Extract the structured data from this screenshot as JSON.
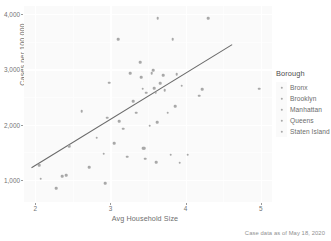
{
  "chart_data": {
    "type": "scatter",
    "title": "",
    "xlabel": "Avg Household Size",
    "ylabel": "Cases per 100,000",
    "caption": "Case data as of May 18, 2020",
    "xlim": [
      1.85,
      5.15
    ],
    "ylim": [
      600,
      4150
    ],
    "xticks": [
      2,
      3,
      4,
      5
    ],
    "xtick_labels": [
      "2",
      "3",
      "4",
      "5"
    ],
    "yticks": [
      1000,
      2000,
      3000,
      4000
    ],
    "ytick_labels": [
      "1,000",
      "2,000",
      "3,000",
      "4,000"
    ],
    "grid": true,
    "point_color": "#a8a8a8",
    "line_color": "#6b6b6b",
    "panel_color": "#fafafa",
    "legend": {
      "title": "Borough",
      "position": "right",
      "entries": [
        {
          "label": "Bronx"
        },
        {
          "label": "Brooklyn"
        },
        {
          "label": "Manhattan"
        },
        {
          "label": "Queens"
        },
        {
          "label": "Staten Island"
        }
      ]
    },
    "trendline": {
      "type": "linear",
      "x": [
        1.95,
        4.62
      ],
      "y": [
        1220,
        3450
      ]
    },
    "points": [
      {
        "x": 2.05,
        "y": 1265
      },
      {
        "x": 2.07,
        "y": 1025
      },
      {
        "x": 2.28,
        "y": 845
      },
      {
        "x": 2.36,
        "y": 1065
      },
      {
        "x": 2.41,
        "y": 1080
      },
      {
        "x": 2.45,
        "y": 1610
      },
      {
        "x": 2.62,
        "y": 2245
      },
      {
        "x": 2.72,
        "y": 1225
      },
      {
        "x": 2.82,
        "y": 1765
      },
      {
        "x": 2.91,
        "y": 1475
      },
      {
        "x": 2.93,
        "y": 940
      },
      {
        "x": 2.96,
        "y": 2125
      },
      {
        "x": 2.98,
        "y": 2760
      },
      {
        "x": 3.05,
        "y": 1665
      },
      {
        "x": 3.1,
        "y": 3545
      },
      {
        "x": 3.12,
        "y": 2060
      },
      {
        "x": 3.17,
        "y": 1925
      },
      {
        "x": 3.22,
        "y": 1420
      },
      {
        "x": 3.26,
        "y": 2930
      },
      {
        "x": 3.3,
        "y": 2425
      },
      {
        "x": 3.34,
        "y": 2215
      },
      {
        "x": 3.4,
        "y": 3130
      },
      {
        "x": 3.41,
        "y": 2855
      },
      {
        "x": 3.43,
        "y": 2655
      },
      {
        "x": 3.44,
        "y": 1575
      },
      {
        "x": 3.45,
        "y": 1570
      },
      {
        "x": 3.46,
        "y": 1385
      },
      {
        "x": 3.48,
        "y": 2580
      },
      {
        "x": 3.52,
        "y": 1985
      },
      {
        "x": 3.55,
        "y": 2935
      },
      {
        "x": 3.57,
        "y": 2990
      },
      {
        "x": 3.58,
        "y": 2665
      },
      {
        "x": 3.6,
        "y": 2580
      },
      {
        "x": 3.61,
        "y": 1325
      },
      {
        "x": 3.62,
        "y": 2045
      },
      {
        "x": 3.63,
        "y": 3930
      },
      {
        "x": 3.66,
        "y": 2755
      },
      {
        "x": 3.7,
        "y": 2900
      },
      {
        "x": 3.72,
        "y": 2625
      },
      {
        "x": 3.76,
        "y": 2215
      },
      {
        "x": 3.8,
        "y": 1455
      },
      {
        "x": 3.83,
        "y": 3545
      },
      {
        "x": 3.86,
        "y": 2330
      },
      {
        "x": 3.88,
        "y": 2910
      },
      {
        "x": 3.92,
        "y": 1310
      },
      {
        "x": 3.95,
        "y": 2705
      },
      {
        "x": 4.03,
        "y": 1455
      },
      {
        "x": 4.18,
        "y": 2525
      },
      {
        "x": 4.22,
        "y": 2645
      },
      {
        "x": 4.3,
        "y": 3925
      },
      {
        "x": 4.98,
        "y": 2655
      }
    ]
  }
}
